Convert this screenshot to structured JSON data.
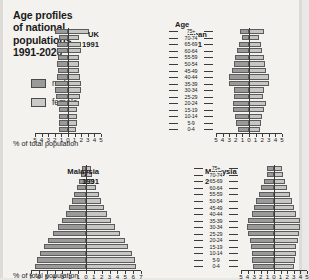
{
  "title": "Age profiles of national populations, 1991-2020",
  "title_lines": [
    "Age profiles",
    "of national",
    "populations,",
    "1991-2020"
  ],
  "legend": {
    "male_label": "male",
    "female_label": "female",
    "male_color": "#9a9a9a",
    "female_color": "#c6c6c4"
  },
  "age_header": "Age",
  "axis_caption_top": "% of total population",
  "axis_caption_bottom": "% of total population",
  "age_groups": [
    "75+",
    "70-74",
    "65-69",
    "60-64",
    "55-59",
    "50-54",
    "45-49",
    "40-44",
    "35-39",
    "30-34",
    "25-29",
    "20-24",
    "15-19",
    "10-14",
    "5-9",
    "0-4"
  ],
  "panels": {
    "uk1991": {
      "country": "UK",
      "year": "1991"
    },
    "japan1991": {
      "country": "Japan",
      "year": "1991"
    },
    "malaysia1991": {
      "country": "Malaysia",
      "year": "1991"
    },
    "malaysia2020": {
      "country": "Malaysia",
      "year": "2020"
    }
  },
  "chart_data": [
    {
      "type": "bar",
      "id": "uk1991",
      "title": "UK 1991",
      "subtype": "population-pyramid",
      "xlabel": "% of total population",
      "ylabel": "Age",
      "categories": [
        "75+",
        "70-74",
        "65-69",
        "60-64",
        "55-59",
        "50-54",
        "45-49",
        "40-44",
        "35-39",
        "30-34",
        "25-29",
        "20-24",
        "15-19",
        "10-14",
        "5-9",
        "0-4"
      ],
      "xlim": [
        0,
        5
      ],
      "xticks": [
        5,
        4,
        3,
        2,
        1,
        0,
        1,
        2,
        3,
        4,
        5
      ],
      "grid": false,
      "legend": [
        "male",
        "female"
      ],
      "legend_position": "upper-left-outside",
      "series": [
        {
          "name": "male",
          "values": [
            1.9,
            1.3,
            1.6,
            1.7,
            1.5,
            1.6,
            1.5,
            1.7,
            2.0,
            1.9,
            1.8,
            1.6,
            1.4,
            1.4,
            1.4,
            1.3
          ]
        },
        {
          "name": "female",
          "values": [
            3.2,
            1.7,
            1.9,
            1.9,
            1.6,
            1.7,
            1.6,
            1.8,
            2.0,
            1.9,
            1.8,
            1.6,
            1.4,
            1.4,
            1.3,
            1.2
          ]
        }
      ]
    },
    {
      "type": "bar",
      "id": "japan1991",
      "title": "Japan 1991",
      "subtype": "population-pyramid",
      "xlabel": "% of total population",
      "ylabel": "Age",
      "categories": [
        "75+",
        "70-74",
        "65-69",
        "60-64",
        "55-59",
        "50-54",
        "45-49",
        "40-44",
        "35-39",
        "30-34",
        "25-29",
        "20-24",
        "15-19",
        "10-14",
        "5-9",
        "0-4"
      ],
      "xlim": [
        0,
        5
      ],
      "xticks": [
        5,
        4,
        3,
        2,
        1,
        0,
        1,
        2,
        3,
        4,
        5
      ],
      "grid": false,
      "legend": [
        "male",
        "female"
      ],
      "legend_position": "upper-left-outside",
      "series": [
        {
          "name": "male",
          "values": [
            1.4,
            1.1,
            1.5,
            1.8,
            2.1,
            2.3,
            2.6,
            3.0,
            3.1,
            2.3,
            2.2,
            2.5,
            2.4,
            2.1,
            1.9,
            1.7
          ]
        },
        {
          "name": "female",
          "values": [
            2.2,
            1.5,
            1.8,
            2.0,
            2.2,
            2.4,
            2.6,
            3.0,
            3.0,
            2.3,
            2.1,
            2.5,
            2.3,
            2.0,
            1.8,
            1.6
          ]
        }
      ]
    },
    {
      "type": "bar",
      "id": "malaysia1991",
      "title": "Malaysia 1991",
      "subtype": "population-pyramid",
      "xlabel": "% of total population",
      "ylabel": "Age",
      "categories": [
        "75+",
        "70-74",
        "65-69",
        "60-64",
        "55-59",
        "50-54",
        "45-49",
        "40-44",
        "35-39",
        "30-34",
        "25-29",
        "20-24",
        "15-19",
        "10-14",
        "5-9",
        "0-4"
      ],
      "xlim": [
        0,
        7
      ],
      "xticks": [
        7,
        6,
        5,
        4,
        3,
        2,
        1,
        0,
        1,
        2,
        3,
        4,
        5,
        6,
        7
      ],
      "grid": false,
      "legend": [
        "male",
        "female"
      ],
      "legend_position": "upper-left-outside",
      "series": [
        {
          "name": "male",
          "values": [
            0.5,
            0.6,
            0.9,
            1.2,
            1.5,
            1.8,
            2.2,
            2.6,
            3.1,
            3.6,
            4.2,
            4.8,
            5.3,
            5.9,
            6.3,
            6.5
          ]
        },
        {
          "name": "female",
          "values": [
            0.6,
            0.7,
            1.0,
            1.3,
            1.6,
            1.9,
            2.3,
            2.7,
            3.2,
            3.7,
            4.3,
            4.9,
            5.3,
            5.8,
            6.2,
            6.3
          ]
        }
      ]
    },
    {
      "type": "bar",
      "id": "malaysia2020",
      "title": "Malaysia 2020",
      "subtype": "population-pyramid",
      "xlabel": "% of total population",
      "ylabel": "Age",
      "categories": [
        "75+",
        "70-74",
        "65-69",
        "60-64",
        "55-59",
        "50-54",
        "45-49",
        "40-44",
        "35-39",
        "30-34",
        "25-29",
        "20-24",
        "15-19",
        "10-14",
        "5-9",
        "0-4"
      ],
      "xlim": [
        0,
        5
      ],
      "xticks": [
        5,
        4,
        3,
        2,
        1,
        0,
        1,
        2,
        3,
        4,
        5
      ],
      "grid": false,
      "legend": [
        "male",
        "female"
      ],
      "legend_position": "upper-left-outside",
      "series": [
        {
          "name": "male",
          "values": [
            1.0,
            1.1,
            1.5,
            1.9,
            2.3,
            2.7,
            3.1,
            3.4,
            4.0,
            4.1,
            3.9,
            3.7,
            3.5,
            3.4,
            3.3,
            3.2
          ]
        },
        {
          "name": "female",
          "values": [
            1.2,
            1.3,
            1.6,
            2.0,
            2.4,
            2.8,
            3.1,
            3.4,
            3.9,
            4.0,
            3.8,
            3.6,
            3.4,
            3.3,
            3.2,
            3.1
          ]
        }
      ]
    }
  ]
}
